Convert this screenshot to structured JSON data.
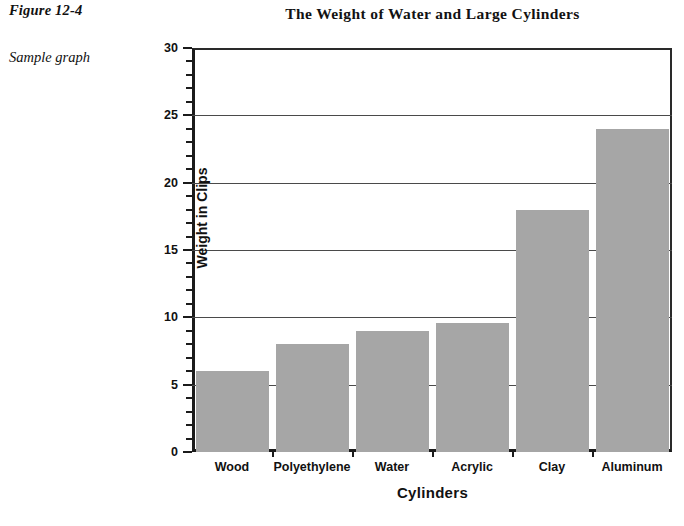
{
  "figure": {
    "caption": "Figure 12-4",
    "note": "Sample graph"
  },
  "chart_data": {
    "type": "bar",
    "title": "The Weight of Water and Large Cylinders",
    "xlabel": "Cylinders",
    "ylabel": "Weight in Clips",
    "categories": [
      "Wood",
      "Polyethylene",
      "Water",
      "Acrylic",
      "Clay",
      "Aluminum"
    ],
    "values": [
      6,
      8,
      9,
      9.6,
      18,
      24
    ],
    "ylim": [
      0,
      30
    ],
    "y_ticks": [
      0,
      5,
      10,
      15,
      20,
      25,
      30
    ],
    "y_tick_labels": [
      "0",
      "5",
      "10",
      "15",
      "20",
      "25",
      "30"
    ],
    "y_minor_tick_step": 1,
    "grid": "horizontal-major",
    "legend": "none",
    "bar_color": "#a6a6a6",
    "axis_color": "#1b1b1b",
    "grid_color": "#4a4a4a",
    "background": "#ffffff"
  }
}
